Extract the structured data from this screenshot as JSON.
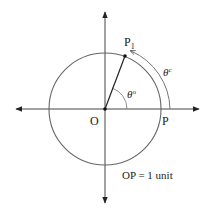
{
  "diagram": {
    "type": "unit-circle-radian-measure",
    "colors": {
      "axis": "#333333",
      "circle": "#555555",
      "radius": "#222222",
      "text": "#222222",
      "background": "#ffffff"
    },
    "labels": {
      "origin": "O",
      "point_p": "P",
      "point_p1": "P",
      "point_p1_subscript": "1",
      "angle_degrees": "θ°",
      "angle_degrees_symbol": "θ",
      "angle_degrees_superscript": "o",
      "angle_radians_symbol": "θ",
      "angle_radians_superscript": "c",
      "caption": "OP = 1 unit"
    }
  }
}
